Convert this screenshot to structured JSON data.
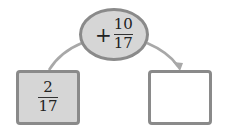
{
  "diagram": {
    "operation": {
      "sign": "+",
      "numerator": "10",
      "denominator": "17"
    },
    "input": {
      "numerator": "2",
      "denominator": "17"
    },
    "output": {
      "value": ""
    },
    "colors": {
      "fill": "#d6d6d6",
      "border": "#8a8a8a",
      "arrow": "#a8a8a8"
    }
  }
}
